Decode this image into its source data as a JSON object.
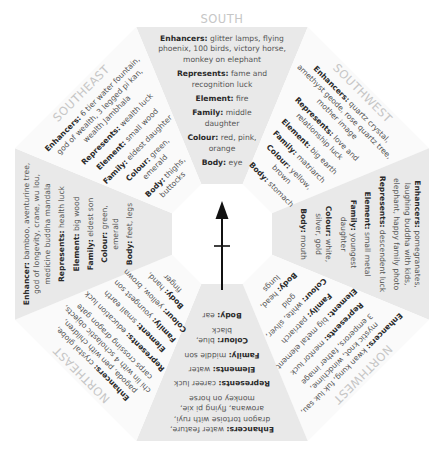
{
  "compass": {
    "icon": "north-arrow-icon",
    "color": "#111111"
  },
  "colors": {
    "shaded_segment": "#e9e9e9",
    "plain_segment": "#fafafa",
    "direction_label": "#c6c6c6",
    "key_text": "#2a2a2a",
    "value_text": "#555555"
  },
  "sectors": [
    {
      "id": "south",
      "label": "SOUTH",
      "shaded": true,
      "lines": [
        [
          {
            "k": "Enhancers:",
            "v": " glitter lamps, flying"
          }
        ],
        [
          {
            "k": "",
            "v": "phoenix, 100 birds, victory horse,"
          }
        ],
        [
          {
            "k": "",
            "v": "monkey on elephant"
          }
        ],
        [
          {
            "k": "Represents:",
            "v": " fame and"
          }
        ],
        [
          {
            "k": "",
            "v": "recognition luck"
          }
        ],
        [
          {
            "k": "Element:",
            "v": " fire"
          }
        ],
        [
          {
            "k": "Family:",
            "v": " middle"
          }
        ],
        [
          {
            "k": "",
            "v": "daughter"
          }
        ],
        [
          {
            "k": "Colour:",
            "v": " red, pink,"
          }
        ],
        [
          {
            "k": "",
            "v": "orange"
          }
        ],
        [
          {
            "k": "Body:",
            "v": " eye"
          }
        ]
      ]
    },
    {
      "id": "southwest",
      "label": "SOUTHWEST",
      "shaded": false,
      "lines": [
        [
          {
            "k": "Enhancers:",
            "v": " quartz crystal,"
          }
        ],
        [
          {
            "k": "",
            "v": "amethyst geode, rose quartz tree,"
          }
        ],
        [
          {
            "k": "",
            "v": "mother image"
          }
        ],
        [
          {
            "k": "Represents:",
            "v": " love and"
          }
        ],
        [
          {
            "k": "",
            "v": "relationship luck"
          }
        ],
        [
          {
            "k": "Element:",
            "v": " big earth"
          }
        ],
        [
          {
            "k": "Family:",
            "v": " matriarch"
          }
        ],
        [
          {
            "k": "Colour:",
            "v": " yellow,"
          }
        ],
        [
          {
            "k": "",
            "v": "brown"
          }
        ],
        [
          {
            "k": "Body:",
            "v": " stomach"
          }
        ]
      ]
    },
    {
      "id": "west",
      "label": "",
      "shaded": true,
      "lines": [
        [
          {
            "k": "Enhancers:",
            "v": " pomegranates,"
          }
        ],
        [
          {
            "k": "",
            "v": "laughing buddha with kids,"
          }
        ],
        [
          {
            "k": "",
            "v": "elephant, happy family photo"
          }
        ],
        [
          {
            "k": "Represents:",
            "v": " descendent luck"
          }
        ],
        [
          {
            "k": "Element:",
            "v": " small metal"
          }
        ],
        [
          {
            "k": "Family:",
            "v": " youngest"
          }
        ],
        [
          {
            "k": "",
            "v": "daughter"
          }
        ],
        [
          {
            "k": "Colour:",
            "v": " white,"
          }
        ],
        [
          {
            "k": "",
            "v": "silver, gold"
          }
        ],
        [
          {
            "k": "Body:",
            "v": " mouth"
          }
        ]
      ]
    },
    {
      "id": "northwest",
      "label": "NORTHWEST",
      "shaded": false,
      "lines": [
        [
          {
            "k": "Enhancers:",
            "v": " kwan kung, fuk luk sau,"
          }
        ],
        [
          {
            "k": "",
            "v": "mystic knot, windchime,"
          }
        ],
        [
          {
            "k": "",
            "v": "3 emperors, father image"
          }
        ],
        [
          {
            "k": "Represents:",
            "v": " mentor luck"
          }
        ],
        [
          {
            "k": "Element:",
            "v": " big metal element"
          }
        ],
        [
          {
            "k": "Family:",
            "v": " patriarch"
          }
        ],
        [
          {
            "k": "Colour:",
            "v": " white, silver,"
          }
        ],
        [
          {
            "k": "",
            "v": "gold"
          }
        ],
        [
          {
            "k": "Body:",
            "v": " head,"
          }
        ],
        [
          {
            "k": "",
            "v": "lungs"
          }
        ]
      ]
    },
    {
      "id": "north",
      "label": "",
      "shaded": true,
      "lines": [
        [
          {
            "k": "Enhancers:",
            "v": " water feature,"
          }
        ],
        [
          {
            "k": "",
            "v": "dragon tortoise with ruyi,"
          }
        ],
        [
          {
            "k": "",
            "v": "arowana, flying pi xie,"
          }
        ],
        [
          {
            "k": "",
            "v": "monkey on horse"
          }
        ],
        [
          {
            "k": "Represents:",
            "v": " career luck"
          }
        ],
        [
          {
            "k": "Elements:",
            "v": " water"
          }
        ],
        [
          {
            "k": "Family:",
            "v": " middle son"
          }
        ],
        [
          {
            "k": "Colour:",
            "v": " blue,"
          }
        ],
        [
          {
            "k": "",
            "v": "black"
          }
        ],
        [
          {
            "k": "Body:",
            "v": " ear"
          }
        ]
      ]
    },
    {
      "id": "northeast",
      "label": "NORTHEAST",
      "shaded": false,
      "lines": [
        [
          {
            "k": "Enhancers:",
            "v": " crystal globe,"
          }
        ],
        [
          {
            "k": "",
            "v": "pagoda, pen with children,"
          }
        ],
        [
          {
            "k": "",
            "v": "chi lin with 4 scholastic objects,"
          }
        ],
        [
          {
            "k": "",
            "v": "carps crossing dragon gate"
          }
        ],
        [
          {
            "k": "Represents:",
            "v": " education luck"
          }
        ],
        [
          {
            "k": "Element:",
            "v": " small earth"
          }
        ],
        [
          {
            "k": "Family:",
            "v": " youngest son"
          }
        ],
        [
          {
            "k": "Colour:",
            "v": " yellow, brown"
          }
        ],
        [
          {
            "k": "Body:",
            "v": " hand,"
          }
        ],
        [
          {
            "k": "",
            "v": "finger"
          }
        ]
      ]
    },
    {
      "id": "east",
      "label": "",
      "shaded": true,
      "lines": [
        [
          {
            "k": "Enhancer:",
            "v": " bamboo, aventurine tree,"
          }
        ],
        [
          {
            "k": "",
            "v": "god of longevity, crane, wu lou,"
          }
        ],
        [
          {
            "k": "",
            "v": "medicine buddha mandala"
          }
        ],
        [
          {
            "k": "Represents:",
            "v": " health luck"
          }
        ],
        [
          {
            "k": "Element:",
            "v": " big wood"
          }
        ],
        [
          {
            "k": "Family:",
            "v": " eldest son"
          }
        ],
        [
          {
            "k": "Colour:",
            "v": " green,"
          }
        ],
        [
          {
            "k": "",
            "v": "emerald"
          }
        ],
        [
          {
            "k": "Body:",
            "v": " feet, legs"
          }
        ]
      ]
    },
    {
      "id": "southeast",
      "label": "SOUTHEAST",
      "shaded": false,
      "lines": [
        [
          {
            "k": "Enhancers:",
            "v": " 6 tier water fountain,"
          }
        ],
        [
          {
            "k": "",
            "v": "god of wealth, 3 legged pi kan,"
          }
        ],
        [
          {
            "k": "",
            "v": "wealth Jambhala"
          }
        ],
        [
          {
            "k": "Represents:",
            "v": " wealth luck"
          }
        ],
        [
          {
            "k": "Element:",
            "v": " small wood"
          }
        ],
        [
          {
            "k": "Family:",
            "v": " eldest daughter"
          }
        ],
        [
          {
            "k": "Colour:",
            "v": " green,"
          }
        ],
        [
          {
            "k": "",
            "v": "emerald"
          }
        ],
        [
          {
            "k": "Body:",
            "v": " thighs,"
          }
        ],
        [
          {
            "k": "",
            "v": "buttocks"
          }
        ]
      ]
    }
  ]
}
